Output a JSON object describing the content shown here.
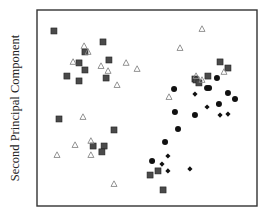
{
  "chart_data": {
    "type": "scatter",
    "title": "",
    "xlabel": "",
    "ylabel": "Second Principal Component",
    "xlim": [
      0,
      100
    ],
    "ylim": [
      0,
      100
    ],
    "grid": false,
    "ticks_shown": false,
    "legend": null,
    "series": [
      {
        "name": "filled-square",
        "marker": "square",
        "color": "#4a4a4a",
        "points": [
          [
            7.7,
            89.3
          ],
          [
            30.0,
            83.7
          ],
          [
            21.8,
            78.6
          ],
          [
            32.7,
            74.5
          ],
          [
            19.1,
            73.0
          ],
          [
            21.8,
            69.4
          ],
          [
            13.6,
            66.3
          ],
          [
            31.4,
            65.3
          ],
          [
            19.1,
            63.8
          ],
          [
            10.0,
            44.4
          ],
          [
            35.0,
            38.8
          ],
          [
            25.5,
            30.6
          ],
          [
            30.5,
            30.6
          ],
          [
            29.5,
            27.6
          ],
          [
            83.2,
            73.5
          ],
          [
            86.8,
            70.4
          ],
          [
            77.7,
            66.3
          ],
          [
            71.8,
            64.8
          ],
          [
            72.3,
            64.3
          ],
          [
            73.6,
            62.8
          ],
          [
            55.0,
            17.9
          ],
          [
            51.4,
            15.8
          ],
          [
            57.3,
            8.2
          ]
        ]
      },
      {
        "name": "open-triangle",
        "marker": "triangle",
        "color": "#888888",
        "points": [
          [
            21.4,
            81.6
          ],
          [
            23.2,
            78.6
          ],
          [
            16.4,
            73.5
          ],
          [
            40.5,
            73.0
          ],
          [
            45.5,
            69.9
          ],
          [
            29.1,
            71.4
          ],
          [
            32.3,
            68.9
          ],
          [
            36.4,
            61.7
          ],
          [
            20.9,
            45.4
          ],
          [
            24.5,
            33.2
          ],
          [
            17.3,
            31.1
          ],
          [
            9.1,
            26.0
          ],
          [
            24.5,
            26.0
          ],
          [
            35.0,
            11.2
          ],
          [
            75.0,
            90.3
          ],
          [
            65.0,
            80.6
          ],
          [
            85.0,
            68.4
          ],
          [
            72.3,
            66.3
          ],
          [
            75.0,
            64.3
          ],
          [
            60.0,
            55.6
          ]
        ]
      },
      {
        "name": "filled-circle",
        "marker": "circle",
        "color": "#111111",
        "points": [
          [
            81.8,
            65.3
          ],
          [
            77.3,
            60.2
          ],
          [
            78.2,
            60.2
          ],
          [
            62.3,
            59.7
          ],
          [
            86.8,
            57.7
          ],
          [
            90.0,
            54.6
          ],
          [
            82.7,
            52.0
          ],
          [
            62.7,
            48.0
          ],
          [
            71.8,
            46.4
          ],
          [
            64.1,
            39.3
          ],
          [
            58.2,
            32.7
          ],
          [
            52.3,
            23.0
          ]
        ]
      },
      {
        "name": "filled-diamond",
        "marker": "diamond",
        "color": "#111111",
        "points": [
          [
            71.8,
            57.1
          ],
          [
            77.3,
            50.5
          ],
          [
            83.2,
            46.4
          ],
          [
            86.8,
            46.9
          ],
          [
            59.5,
            25.5
          ],
          [
            56.8,
            21.4
          ],
          [
            59.5,
            17.9
          ],
          [
            69.5,
            18.9
          ]
        ]
      }
    ]
  }
}
